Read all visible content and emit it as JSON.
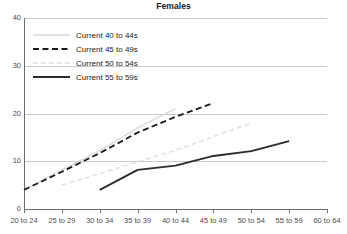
{
  "chart_data": {
    "type": "line",
    "title": "Females",
    "xlabel": "",
    "ylabel": "",
    "ylim": [
      0,
      40
    ],
    "yticks": [
      0,
      10,
      20,
      30,
      40
    ],
    "grid": true,
    "legend_position": "upper-left",
    "categories": [
      "20 to 24",
      "25 to 29",
      "30 to 34",
      "35 to 39",
      "40 to 44",
      "45 to 49",
      "50 to 54",
      "55 to 59",
      "60 to 64"
    ],
    "series": [
      {
        "name": "Current 40 to 44s",
        "style": "solid-light",
        "color": "#d9d9d9",
        "x": [
          "20 to 24",
          "25 to 29",
          "30 to 34",
          "35 to 39",
          "40 to 44"
        ],
        "values": [
          4.0,
          8.2,
          12.2,
          17.0,
          21.0
        ]
      },
      {
        "name": "Current 45 to 49s",
        "style": "dashed-dark",
        "color": "#1a1a1a",
        "x": [
          "20 to 24",
          "25 to 29",
          "30 to 34",
          "35 to 39",
          "40 to 44",
          "45 to 49"
        ],
        "values": [
          4.0,
          7.8,
          11.7,
          16.0,
          19.3,
          22.2
        ]
      },
      {
        "name": "Current 50 to 54s",
        "style": "dotted-light",
        "color": "#e2e2e2",
        "x": [
          "25 to 29",
          "30 to 34",
          "35 to 39",
          "40 to 44",
          "45 to 49",
          "50 to 54"
        ],
        "values": [
          5.0,
          7.4,
          9.9,
          12.3,
          15.2,
          18.0
        ]
      },
      {
        "name": "Current 55 to 59s",
        "style": "solid-dark",
        "color": "#2b2b2b",
        "x": [
          "30 to 34",
          "35 to 39",
          "40 to 44",
          "45 to 49",
          "50 to 54",
          "55 to 59"
        ],
        "values": [
          4.0,
          8.2,
          9.1,
          11.1,
          12.1,
          14.2
        ]
      }
    ]
  },
  "axis": {
    "y_tick_labels": [
      "40",
      "30",
      "20",
      "10",
      "0"
    ],
    "x_tick_labels": [
      "20 to 24",
      "25 to 29",
      "30 to 34",
      "35 to 39",
      "40 to 44",
      "45 to 49",
      "50 to 54",
      "55 to 59",
      "60 to 64"
    ]
  },
  "legend": {
    "items": [
      {
        "label": "Current 40 to 44s"
      },
      {
        "label": "Current 45 to 49s"
      },
      {
        "label": "Current 50 to 54s"
      },
      {
        "label": "Current 55 to 59s"
      }
    ]
  },
  "colors": {
    "axis": "#6e6e6e",
    "grid": "#c8c8c8",
    "text": "#4d4d4d",
    "title": "#1a1a1a"
  }
}
